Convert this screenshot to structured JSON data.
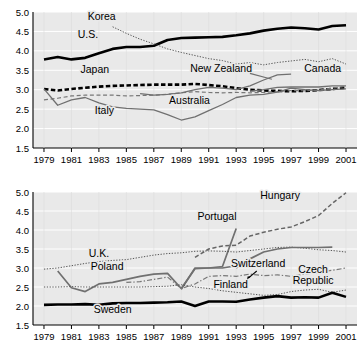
{
  "chart_data": [
    {
      "type": "line",
      "panel": "top",
      "title": "",
      "xlabel": "",
      "ylabel": "",
      "xlim": [
        1978.2,
        2001.8
      ],
      "ylim": [
        1.5,
        5.0
      ],
      "yticks": [
        "1.5",
        "2.0",
        "2.5",
        "3.0",
        "3.5",
        "4.0",
        "4.5",
        "5.0"
      ],
      "xticks": [
        "1979",
        "1981",
        "1983",
        "1985",
        "1987",
        "1989",
        "1991",
        "1993",
        "1995",
        "1997",
        "1999",
        "2001"
      ],
      "grid": true,
      "legend": "inline-labels",
      "x": [
        1979,
        1980,
        1981,
        1982,
        1983,
        1984,
        1985,
        1986,
        1987,
        1988,
        1989,
        1990,
        1991,
        1992,
        1993,
        1994,
        1995,
        1996,
        1997,
        1998,
        1999,
        2000,
        2001
      ],
      "series": [
        {
          "name": "U.S.",
          "style": "solid-thick-black",
          "color": "#000000",
          "label_x": 1982.2,
          "label_y": 4.33,
          "values": [
            3.78,
            3.84,
            3.78,
            3.82,
            3.94,
            4.05,
            4.1,
            4.1,
            4.13,
            4.28,
            4.33,
            4.34,
            4.35,
            4.36,
            4.4,
            4.45,
            4.52,
            4.57,
            4.6,
            4.58,
            4.55,
            4.64,
            4.66
          ]
        },
        {
          "name": "Korea",
          "style": "dotted-fine-gray",
          "color": "#555555",
          "label_x": 1983.2,
          "label_y": 4.8,
          "values": [
            null,
            null,
            null,
            null,
            null,
            4.62,
            4.45,
            4.3,
            4.18,
            4.05,
            3.96,
            3.88,
            3.8,
            3.75,
            3.66,
            3.7,
            3.64,
            3.7,
            3.74,
            3.78,
            3.72,
            3.8,
            3.66
          ]
        },
        {
          "name": "Japan",
          "style": "dashed-thick-black",
          "color": "#000000",
          "label_x": 1982.7,
          "label_y": 3.44,
          "values": [
            3.02,
            2.98,
            3.02,
            3.05,
            3.08,
            3.1,
            3.11,
            3.12,
            3.13,
            3.13,
            3.13,
            3.15,
            3.12,
            3.09,
            3.04,
            3.0,
            2.98,
            2.97,
            2.96,
            2.97,
            2.99,
            3.02,
            3.05
          ]
        },
        {
          "name": "Australia",
          "style": "dashed-thin-gray",
          "color": "#777777",
          "label_x": 1989.6,
          "label_y": 2.64,
          "values": [
            2.74,
            2.78,
            2.84,
            2.86,
            2.86,
            2.86,
            2.84,
            2.85,
            2.86,
            2.88,
            2.92,
            2.95,
            2.93,
            2.92,
            2.93,
            2.92,
            2.93,
            2.95,
            2.98,
            2.97,
            2.99,
            3.04,
            3.09
          ]
        },
        {
          "name": "Italy",
          "style": "solid-thin-gray",
          "color": "#707070",
          "label_x": 1983.4,
          "label_y": 2.38,
          "values": [
            3.02,
            2.6,
            2.74,
            2.8,
            2.66,
            2.56,
            2.52,
            2.5,
            2.48,
            2.36,
            2.22,
            2.3,
            2.46,
            2.62,
            2.8,
            2.86,
            2.88,
            2.94,
            3.04,
            3.0,
            2.98,
            3.0,
            3.02
          ]
        },
        {
          "name": "New Zealand",
          "style": "solid-thin-gray",
          "color": "#707070",
          "label_x": 1991.9,
          "label_y": 3.46,
          "values": [
            null,
            null,
            null,
            null,
            null,
            null,
            null,
            2.9,
            2.86,
            2.88,
            2.92,
            3.0,
            3.06,
            3.04,
            3.0,
            3.1,
            3.25,
            3.38,
            3.4,
            null,
            null,
            null,
            null
          ]
        },
        {
          "name": "Canada",
          "style": "solid-thin-gray",
          "color": "#707070",
          "label_x": 1999.3,
          "label_y": 3.46,
          "values": [
            null,
            null,
            null,
            null,
            null,
            null,
            null,
            null,
            null,
            null,
            null,
            null,
            null,
            null,
            null,
            2.96,
            3.0,
            3.06,
            3.07,
            3.07,
            3.07,
            3.1,
            3.1
          ]
        }
      ]
    },
    {
      "type": "line",
      "panel": "bottom",
      "title": "",
      "xlabel": "",
      "ylabel": "",
      "xlim": [
        1978.2,
        2001.8
      ],
      "ylim": [
        1.5,
        5.0
      ],
      "yticks": [
        "1.5",
        "2.0",
        "2.5",
        "3.0",
        "3.5",
        "4.0",
        "4.5",
        "5.0"
      ],
      "xticks": [
        "1979",
        "1981",
        "1983",
        "1985",
        "1987",
        "1989",
        "1991",
        "1993",
        "1995",
        "1997",
        "1999",
        "2001"
      ],
      "grid": true,
      "legend": "inline-labels",
      "x": [
        1979,
        1980,
        1981,
        1982,
        1983,
        1984,
        1985,
        1986,
        1987,
        1988,
        1989,
        1990,
        1991,
        1992,
        1993,
        1994,
        1995,
        1996,
        1997,
        1998,
        1999,
        2000,
        2001
      ],
      "series": [
        {
          "name": "Hungary",
          "style": "dashed-medium-gray",
          "color": "#666666",
          "label_x": 1996.2,
          "label_y": 4.82,
          "values": [
            null,
            null,
            null,
            null,
            null,
            null,
            null,
            null,
            null,
            null,
            null,
            3.28,
            3.5,
            3.58,
            3.6,
            3.84,
            3.94,
            4.02,
            4.08,
            4.22,
            4.38,
            4.7,
            4.98
          ]
        },
        {
          "name": "Portugal",
          "style": "solid-medium-gray",
          "color": "#707070",
          "label_x": 1991.6,
          "label_y": 4.26,
          "values": [
            null,
            null,
            null,
            null,
            null,
            null,
            null,
            null,
            null,
            null,
            2.44,
            3.0,
            3.0,
            3.04,
            4.04,
            null,
            null,
            null,
            null,
            null,
            null,
            null,
            null
          ]
        },
        {
          "name": "U.K.",
          "style": "dotted-fine-gray",
          "color": "#555555",
          "label_x": 1983.0,
          "label_y": 3.3,
          "values": [
            2.97,
            3.0,
            3.06,
            3.12,
            3.17,
            3.2,
            3.22,
            3.28,
            3.34,
            3.38,
            3.4,
            3.44,
            3.45,
            3.44,
            3.42,
            3.46,
            3.5,
            3.54,
            3.55,
            3.52,
            3.48,
            3.46,
            3.42
          ]
        },
        {
          "name": "Switzerland",
          "style": "solid-medium-gray",
          "color": "#707070",
          "label_x": 1994.6,
          "label_y": 3.02,
          "values": [
            null,
            null,
            null,
            null,
            null,
            null,
            null,
            null,
            null,
            null,
            null,
            null,
            null,
            null,
            3.0,
            3.24,
            3.42,
            3.5,
            3.54,
            3.54,
            3.54,
            3.55,
            null
          ]
        },
        {
          "name": "Poland",
          "style": "solid-medium-gray",
          "color": "#707070",
          "label_x": 1983.6,
          "label_y": 2.94,
          "values": [
            null,
            2.92,
            2.48,
            2.38,
            2.58,
            2.62,
            2.7,
            2.78,
            2.84,
            2.86,
            2.46,
            2.98,
            3.0,
            3.0,
            3.06,
            null,
            null,
            null,
            null,
            null,
            null,
            null,
            null
          ]
        },
        {
          "name": "Czech Republic",
          "style": "dash-dot-gray",
          "color": "#777777",
          "label_x": 1998.6,
          "label_y": 2.88,
          "values": [
            null,
            null,
            null,
            null,
            null,
            null,
            2.62,
            2.64,
            2.7,
            2.76,
            2.46,
            2.58,
            2.78,
            2.8,
            2.78,
            2.84,
            2.8,
            2.82,
            2.78,
            2.84,
            2.88,
            2.94,
            3.0
          ]
        },
        {
          "name": "Finland",
          "style": "dotted-fine-gray",
          "color": "#555555",
          "label_x": 1992.6,
          "label_y": 2.48,
          "values": [
            2.5,
            2.5,
            2.51,
            2.5,
            2.5,
            2.5,
            2.5,
            2.5,
            2.51,
            2.52,
            2.56,
            2.5,
            2.46,
            2.4,
            2.36,
            2.32,
            2.28,
            2.3,
            2.38,
            2.42,
            2.44,
            2.36,
            2.42
          ]
        },
        {
          "name": "Sweden",
          "style": "solid-thick-black",
          "color": "#000000",
          "label_x": 1984.0,
          "label_y": 1.82,
          "values": [
            2.03,
            2.04,
            2.04,
            2.05,
            2.03,
            2.07,
            2.08,
            2.08,
            2.09,
            2.1,
            2.12,
            2.0,
            2.12,
            2.12,
            2.11,
            2.17,
            2.22,
            2.26,
            2.22,
            2.23,
            2.22,
            2.35,
            2.24
          ]
        }
      ]
    }
  ]
}
